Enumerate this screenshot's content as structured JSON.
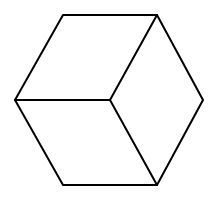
{
  "diagram": {
    "type": "isometric-cube-line-drawing",
    "stroke_color": "#000000",
    "background_color": "#ffffff",
    "stroke_width": 2,
    "vertices": {
      "top_left": [
        63,
        15
      ],
      "top_right": [
        157,
        15
      ],
      "left": [
        15,
        100
      ],
      "center": [
        110,
        100
      ],
      "right": [
        203,
        100
      ],
      "bottom_left": [
        63,
        185
      ],
      "bottom_right": [
        157,
        185
      ]
    },
    "outline_points": "63,15 157,15 203,100 157,185 63,185 15,100",
    "inner_edges": [
      {
        "name": "center-to-left",
        "from": [
          110,
          100
        ],
        "to": [
          15,
          100
        ]
      },
      {
        "name": "center-to-top-right",
        "from": [
          110,
          100
        ],
        "to": [
          157,
          15
        ]
      },
      {
        "name": "center-to-bottom-right",
        "from": [
          110,
          100
        ],
        "to": [
          157,
          185
        ]
      }
    ]
  }
}
